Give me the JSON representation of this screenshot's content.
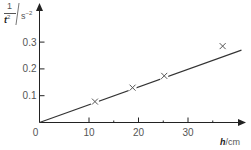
{
  "chart_data": {
    "type": "scatter",
    "title": "",
    "xlabel": "h/cm",
    "ylabel": "1/t² / s⁻²",
    "xlabel_parts": {
      "symbol": "h",
      "unit": "cm"
    },
    "ylabel_parts": {
      "numerator": "1",
      "symbol": "t",
      "power": "2",
      "unit": "s",
      "unit_power": "−2"
    },
    "x_ticks": [
      0,
      10,
      20,
      30
    ],
    "x_minor_ticks": [
      15,
      25,
      35
    ],
    "y_ticks": [
      0.1,
      0.2,
      0.3
    ],
    "origin_label": "0",
    "xlim": [
      0,
      41
    ],
    "ylim": [
      0,
      0.44
    ],
    "grid": false,
    "marker": "x",
    "series": [
      {
        "name": "measurements",
        "x": [
          11.2,
          18.8,
          25.2,
          37.0
        ],
        "y": [
          0.078,
          0.13,
          0.174,
          0.285
        ]
      }
    ],
    "best_fit_line": {
      "from": [
        0,
        0
      ],
      "to": [
        40.8,
        0.27
      ],
      "slope": 0.0066
    },
    "colors": {
      "axis": "#222222",
      "line": "#333333",
      "marker": "#555555",
      "text": "#555555"
    }
  }
}
